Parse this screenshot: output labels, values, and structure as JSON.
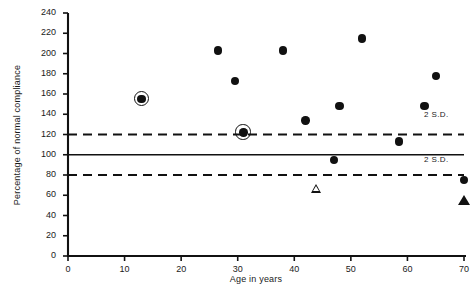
{
  "chart_data": {
    "type": "scatter",
    "title": "",
    "xlabel": "Age in years",
    "ylabel": "Percentage of normal compliance",
    "xlim": [
      0,
      70
    ],
    "ylim": [
      0,
      240
    ],
    "xticks": [
      0,
      10,
      20,
      30,
      40,
      50,
      60,
      70
    ],
    "yticks": [
      0,
      20,
      40,
      60,
      80,
      100,
      120,
      140,
      160,
      180,
      200,
      220,
      240
    ],
    "grid": false,
    "legend_position": "none",
    "reference_lines": [
      {
        "name": "upper-2sd",
        "y": 120,
        "style": "dashed",
        "label": "2 S.D."
      },
      {
        "name": "mean",
        "y": 100,
        "style": "solid",
        "label": ""
      },
      {
        "name": "lower-2sd",
        "y": 80,
        "style": "dashed",
        "label": "2 S.D."
      }
    ],
    "series": [
      {
        "name": "filled-circle",
        "marker": "filled-circle",
        "points": [
          {
            "x": 26.5,
            "y": 203
          },
          {
            "x": 29.5,
            "y": 173
          },
          {
            "x": 38.0,
            "y": 203
          },
          {
            "x": 42.0,
            "y": 134
          },
          {
            "x": 47.0,
            "y": 95
          },
          {
            "x": 48.0,
            "y": 148
          },
          {
            "x": 52.0,
            "y": 215
          },
          {
            "x": 58.5,
            "y": 113
          },
          {
            "x": 63.0,
            "y": 148
          },
          {
            "x": 65.0,
            "y": 178
          },
          {
            "x": 70.0,
            "y": 75
          }
        ]
      },
      {
        "name": "circled-filled-circle",
        "marker": "filled-circle-with-ring",
        "points": [
          {
            "x": 13.0,
            "y": 155
          },
          {
            "x": 31.0,
            "y": 122
          }
        ]
      },
      {
        "name": "open-triangle",
        "marker": "open-triangle",
        "points": [
          {
            "x": 44.0,
            "y": 67
          }
        ]
      },
      {
        "name": "filled-triangle",
        "marker": "filled-triangle",
        "points": [
          {
            "x": 70.0,
            "y": 55
          }
        ]
      }
    ]
  },
  "labels": {
    "upper_sd": "2 S.D.",
    "lower_sd": "2 S.D."
  },
  "colors": {
    "marker": "#111111",
    "axis": "#1a1a1a",
    "background": "#ffffff"
  }
}
